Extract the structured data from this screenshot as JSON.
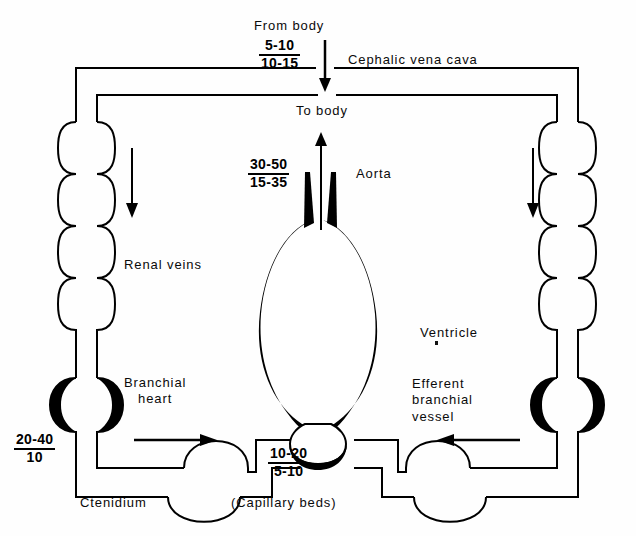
{
  "diagram": {
    "background_color": "#fefefe",
    "ink_color": "#000000",
    "labels": {
      "from_body": "From body",
      "cephalic_vena_cava": "Cephalic vena cava",
      "to_body": "To body",
      "aorta": "Aorta",
      "renal_veins": "Renal veins",
      "ventricle": "Ventricle",
      "branchial_heart": "Branchial\nheart",
      "branchial_heart_line1": "Branchial",
      "branchial_heart_line2": "heart",
      "efferent_branchial_vessel": "Efferent\nbranchial\nvessel",
      "efferent_line1": "Efferent",
      "efferent_line2": "branchial",
      "efferent_line3": "vessel",
      "ctenidium": "Ctenidium",
      "capillary_beds": "(Capillary beds)"
    },
    "pressures": [
      {
        "id": "vena-cava-pressure",
        "name": "cephalic vena cava pressure",
        "systolic": "5-10",
        "diastolic": "10-15",
        "units": "cm H2O"
      },
      {
        "id": "aorta-pressure",
        "name": "aorta pressure",
        "systolic": "30-50",
        "diastolic": "15-35",
        "units": "cm H2O"
      },
      {
        "id": "branchial-heart-pressure",
        "name": "branchial heart pressure",
        "systolic": "20-40",
        "diastolic": "10",
        "units": "cm H2O"
      },
      {
        "id": "efferent-branchial-pressure",
        "name": "efferent branchial vessel pressure",
        "systolic": "10-20",
        "diastolic": "5-10",
        "units": "cm H2O"
      }
    ],
    "flow_arrows": [
      {
        "id": "arrow-from-body",
        "direction": "down",
        "near": "From body inflow"
      },
      {
        "id": "arrow-to-body",
        "direction": "up",
        "near": "To body outflow"
      },
      {
        "id": "arrow-left-vena-cava",
        "direction": "down",
        "near": "left renal vein chain"
      },
      {
        "id": "arrow-right-vena-cava",
        "direction": "down",
        "near": "right renal vein chain"
      },
      {
        "id": "arrow-left-ctenidium",
        "direction": "right",
        "near": "left ctenidium"
      },
      {
        "id": "arrow-right-ctenidium",
        "direction": "left",
        "near": "right ctenidium"
      }
    ]
  }
}
